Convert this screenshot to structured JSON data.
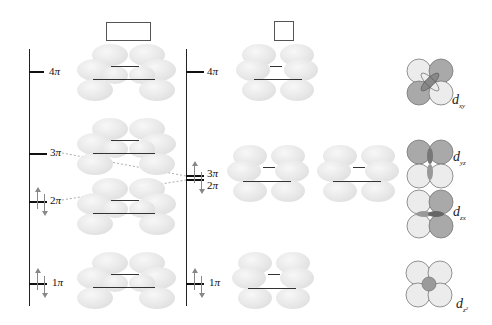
{
  "diagram": {
    "columns": [
      {
        "id": "left",
        "header_box": "wide-rectangle",
        "levels": [
          {
            "label_num": "4",
            "label_sym": "π",
            "electrons": 0
          },
          {
            "label_num": "3",
            "label_sym": "π",
            "electrons": 0
          },
          {
            "label_num": "2",
            "label_sym": "π",
            "electrons": 2
          },
          {
            "label_num": "1",
            "label_sym": "π",
            "electrons": 2
          }
        ]
      },
      {
        "id": "right",
        "header_box": "square",
        "levels": [
          {
            "label_num": "4",
            "label_sym": "π",
            "electrons": 0
          },
          {
            "label_num": "3",
            "label_sym": "π",
            "electrons": 0,
            "degenerate_with": "2π"
          },
          {
            "label_num": "2",
            "label_sym": "π",
            "electrons": 2
          },
          {
            "label_num": "1",
            "label_sym": "π",
            "electrons": 2
          }
        ]
      }
    ],
    "labels": {
      "l4": "4",
      "l3": "3",
      "l2": "2",
      "l1": "1",
      "r4": "4",
      "r3": "3",
      "r2": "2",
      "r1": "1",
      "pi": "π"
    },
    "d_orbitals": [
      {
        "d": "d",
        "sub": "xy"
      },
      {
        "d": "d",
        "sub": "yz"
      },
      {
        "d": "d",
        "sub": "zx"
      },
      {
        "d": "d",
        "sub": "z²"
      }
    ],
    "colors": {
      "lobe_light": "#f0f0f0",
      "lobe_dark": "#a8a8a8",
      "axis": "#222222",
      "dashed": "#999999"
    }
  }
}
